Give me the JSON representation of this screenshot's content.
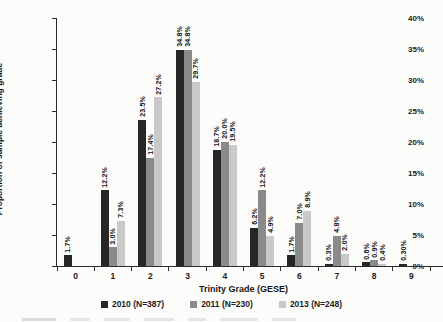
{
  "figure": {
    "y_axis_title": "Proportion of sample achieving grade",
    "x_axis_title": "Trinity Grade (GESE)",
    "y_tick_labels": [
      "0%",
      "5%",
      "10%",
      "15%",
      "20%",
      "25%",
      "30%",
      "35%",
      "40%"
    ],
    "colors": {
      "series_2010": "#262626",
      "series_2011": "#8a8a8a",
      "series_2013": "#c9c9c9",
      "axis": "#2b2b2b"
    }
  },
  "chart_data": {
    "type": "bar",
    "title": "",
    "xlabel": "Trinity Grade (GESE)",
    "ylabel": "Proportion of sample achieving grade",
    "categories": [
      "0",
      "1",
      "2",
      "3",
      "4",
      "5",
      "6",
      "7",
      "8",
      "9"
    ],
    "ylim": [
      0,
      40
    ],
    "y_tick_step": 5,
    "grid": false,
    "legend_position": "bottom",
    "series": [
      {
        "name": "2010 (N=387)",
        "color": "#262626",
        "values": [
          1.7,
          12.2,
          23.5,
          34.8,
          18.7,
          6.2,
          1.7,
          0.3,
          0.6,
          0.3
        ],
        "labels": [
          "1.7%",
          "12.2%",
          "23.5%",
          "34.8%",
          "18.7%",
          "6.2%",
          "1.7%",
          "0.3%",
          "0.6%",
          "0.30%"
        ]
      },
      {
        "name": "2011 (N=230)",
        "color": "#8a8a8a",
        "values": [
          null,
          3.0,
          17.4,
          34.8,
          20.0,
          12.2,
          7.0,
          4.8,
          0.9,
          null
        ],
        "labels": [
          null,
          "3.0%",
          "17.4%",
          "34.8%",
          "20.0%",
          "12.2%",
          "7.0%",
          "4.8%",
          "0.9%",
          null
        ]
      },
      {
        "name": "2013 (N=248)",
        "color": "#c9c9c9",
        "values": [
          null,
          7.3,
          27.2,
          29.7,
          19.5,
          4.9,
          8.9,
          2.0,
          0.4,
          null
        ],
        "labels": [
          null,
          "7.3%",
          "27.2%",
          "29.7%",
          "19.5%",
          "4.9%",
          "8.9%",
          "2.0%",
          "0.4%",
          null
        ]
      }
    ]
  }
}
